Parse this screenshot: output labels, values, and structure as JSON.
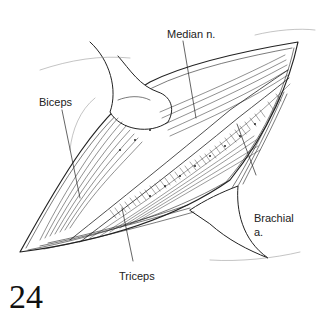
{
  "figure": {
    "number": "24",
    "labels": {
      "median": "Median n.",
      "biceps": "Biceps",
      "brachial_line1": "Brachial",
      "brachial_line2": "a.",
      "triceps": "Triceps"
    },
    "colors": {
      "ink": "#222222",
      "background": "#ffffff"
    }
  }
}
